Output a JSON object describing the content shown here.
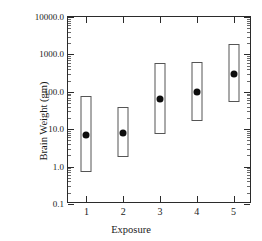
{
  "chart_data": {
    "type": "bar",
    "title": "",
    "xlabel": "Exposure",
    "ylabel": "Brain Weight (gm)",
    "yscale": "log",
    "ylim": [
      0.1,
      10000.0
    ],
    "xlim": [
      0.5,
      5.5
    ],
    "grid": false,
    "legend": null,
    "ytick_labels": [
      "0.1",
      "1.0",
      "10.0",
      "100.0",
      "1000.0",
      "10000.0"
    ],
    "ytick_values": [
      0.1,
      1.0,
      10.0,
      100.0,
      1000.0,
      10000.0
    ],
    "xtick_labels": [
      "1",
      "2",
      "3",
      "4",
      "5"
    ],
    "categories": [
      "1",
      "2",
      "3",
      "4",
      "5"
    ],
    "values": [
      7,
      8,
      65,
      100,
      300
    ],
    "range_low": [
      0.72,
      1.8,
      7.5,
      17,
      52
    ],
    "range_high": [
      76,
      40,
      600,
      640,
      1900
    ],
    "series": [
      {
        "name": "Mean brain weight",
        "marker": "filled-circle",
        "values": [
          7,
          8,
          65,
          100,
          300
        ]
      },
      {
        "name": "Range box",
        "marker": "open-rectangle",
        "low": [
          0.72,
          1.8,
          7.5,
          17,
          52
        ],
        "high": [
          76,
          40,
          600,
          640,
          1900
        ]
      }
    ]
  },
  "figure": {
    "axis_color": "#2b2b2b",
    "marker_color": "#0d0d0d",
    "box_edge_color": "#555555",
    "background": "#ffffff"
  }
}
